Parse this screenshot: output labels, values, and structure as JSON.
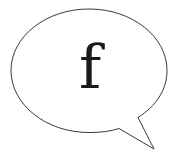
{
  "speech_bubble": {
    "letter": "f",
    "outline_color": "#3a3a3a",
    "fill_color": "#ffffff",
    "letter_color": "#1a1a1a",
    "icon": "speech-bubble-icon"
  }
}
